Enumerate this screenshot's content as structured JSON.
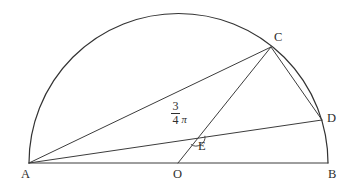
{
  "figure": {
    "type": "euclidean-geometry-diagram",
    "background_color": "#ffffff",
    "stroke_color": "#3c3c3c",
    "label_color": "#2e2e2e"
  },
  "points": {
    "A": {
      "label": "A",
      "x": 29,
      "y": 163,
      "label_x": 21,
      "label_y": 168
    },
    "B": {
      "label": "B",
      "x": 328,
      "y": 163,
      "label_x": 328,
      "label_y": 168
    },
    "C": {
      "label": "C",
      "x": 271,
      "y": 47,
      "label_x": 274,
      "label_y": 31
    },
    "D": {
      "label": "D",
      "x": 322,
      "y": 120,
      "label_x": 327,
      "label_y": 112
    },
    "E": {
      "label": "E",
      "x": 196,
      "y": 137,
      "label_x": 198,
      "label_y": 140
    },
    "O": {
      "label": "O",
      "x": 178,
      "y": 163,
      "label_x": 173,
      "label_y": 168
    }
  },
  "arc": {
    "name": "semicircle-ACB",
    "center_x": 178,
    "center_y": 163,
    "radius": 149,
    "start_x": 29,
    "start_y": 163,
    "end_x": 328,
    "end_y": 163
  },
  "segments": [
    {
      "name": "segment-AB",
      "from": "A",
      "to": "B"
    },
    {
      "name": "segment-AC",
      "from": "A",
      "to": "C"
    },
    {
      "name": "segment-AD",
      "from": "A",
      "to": "D"
    },
    {
      "name": "segment-CD",
      "from": "C",
      "to": "D"
    },
    {
      "name": "segment-CO",
      "from": "C",
      "to": "O"
    }
  ],
  "angle": {
    "name": "angle-at-E",
    "vertex": "E",
    "numerator": "3",
    "denominator": "4",
    "symbol": "π",
    "value_text": "3/4 π",
    "label_x": 171,
    "label_y": 100,
    "marker_radius": 9
  }
}
